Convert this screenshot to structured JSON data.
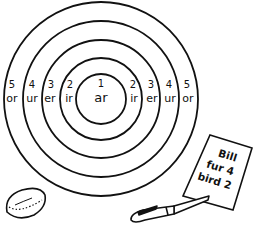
{
  "target": {
    "rings": [
      {
        "points": "1",
        "sound": "ar"
      },
      {
        "points": "2",
        "sound": "ir"
      },
      {
        "points": "3",
        "sound": "er"
      },
      {
        "points": "4",
        "sound": "ur"
      },
      {
        "points": "5",
        "sound": "or"
      }
    ]
  },
  "scorecard": {
    "lines": [
      "Bill",
      "fur 4",
      "bird 2"
    ]
  },
  "objects": {
    "disc": "beanbag-disc",
    "pen": "pen"
  }
}
